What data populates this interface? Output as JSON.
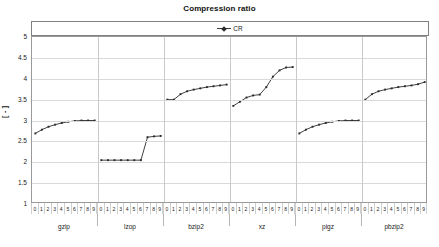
{
  "chart_data": {
    "type": "line",
    "title": "Compression ratio",
    "xlabel": "",
    "ylabel": "[ - ]",
    "ylim": [
      1,
      5
    ],
    "ytick_step": 0.5,
    "yticks": [
      "5",
      "4.5",
      "4",
      "3.5",
      "3",
      "2.5",
      "2",
      "1.5",
      "1"
    ],
    "grid": true,
    "legend": {
      "position": "top",
      "entries": [
        "CR"
      ]
    },
    "x_group_labels": [
      "gzip",
      "lzop",
      "bzip2",
      "xz",
      "pigz",
      "pbzip2"
    ],
    "x_level_labels": [
      "0",
      "1",
      "2",
      "3",
      "4",
      "5",
      "6",
      "7",
      "8",
      "9"
    ],
    "series": [
      {
        "name": "CR",
        "color": "#2b2b2b",
        "groups": [
          {
            "group": "gzip",
            "x": [
              0,
              1,
              2,
              3,
              4,
              5,
              6,
              7,
              8,
              9
            ],
            "values": [
              2.69,
              2.78,
              2.85,
              2.9,
              2.94,
              2.97,
              2.99,
              3.0,
              3.0,
              3.0
            ]
          },
          {
            "group": "lzop",
            "x": [
              0,
              1,
              2,
              3,
              4,
              5,
              6,
              7,
              8,
              9
            ],
            "values": [
              2.05,
              2.05,
              2.05,
              2.05,
              2.05,
              2.05,
              2.05,
              2.6,
              2.62,
              2.63
            ]
          },
          {
            "group": "bzip2",
            "x": [
              0,
              1,
              2,
              3,
              4,
              5,
              6,
              7,
              8,
              9
            ],
            "values": [
              3.5,
              3.5,
              3.63,
              3.7,
              3.74,
              3.77,
              3.8,
              3.82,
              3.84,
              3.86
            ]
          },
          {
            "group": "xz",
            "x": [
              0,
              1,
              2,
              3,
              4,
              5,
              6,
              7,
              8,
              9
            ],
            "values": [
              3.35,
              3.45,
              3.55,
              3.6,
              3.62,
              3.8,
              4.05,
              4.2,
              4.27,
              4.28
            ]
          },
          {
            "group": "pigz",
            "x": [
              0,
              1,
              2,
              3,
              4,
              5,
              6,
              7,
              8,
              9
            ],
            "values": [
              2.69,
              2.78,
              2.85,
              2.9,
              2.94,
              2.97,
              2.99,
              3.0,
              3.0,
              3.0
            ]
          },
          {
            "group": "pbzip2",
            "x": [
              0,
              1,
              2,
              3,
              4,
              5,
              6,
              7,
              8,
              9
            ],
            "values": [
              3.5,
              3.63,
              3.7,
              3.74,
              3.77,
              3.8,
              3.82,
              3.84,
              3.87,
              3.92
            ]
          }
        ]
      }
    ]
  },
  "chart": {
    "title": "Compression ratio",
    "legend_label": "CR",
    "y_axis_title": "[ - ]"
  }
}
